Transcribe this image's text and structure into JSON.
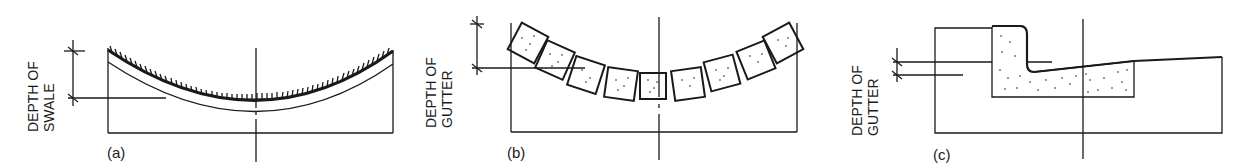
{
  "figure": {
    "panels": [
      {
        "id": "a",
        "caption": "(a)",
        "dimension_label_line1": "DEPTH OF",
        "dimension_label_line2": "SWALE",
        "subject": "grass-lined swale"
      },
      {
        "id": "b",
        "caption": "(b)",
        "dimension_label_line1": "DEPTH OF",
        "dimension_label_line2": "GUTTER",
        "subject": "paver-block gutter"
      },
      {
        "id": "c",
        "caption": "(c)",
        "dimension_label_line1": "DEPTH OF",
        "dimension_label_line2": "GUTTER",
        "subject": "concrete curb and gutter"
      }
    ],
    "colors": {
      "ink": "#1a1a1a",
      "background": "#ffffff"
    }
  }
}
